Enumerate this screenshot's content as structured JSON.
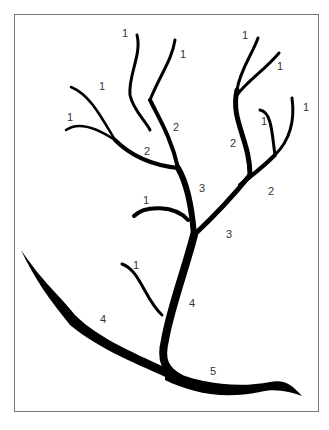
{
  "diagram": {
    "type": "stream-order network",
    "labels": [
      {
        "id": "l1",
        "text": "1",
        "x": 122,
        "y": 28
      },
      {
        "id": "l2",
        "text": "1",
        "x": 180,
        "y": 49
      },
      {
        "id": "l3",
        "text": "1",
        "x": 99,
        "y": 81
      },
      {
        "id": "l4",
        "text": "1",
        "x": 67,
        "y": 112
      },
      {
        "id": "l5",
        "text": "2",
        "x": 173,
        "y": 122
      },
      {
        "id": "l6",
        "text": "2",
        "x": 144,
        "y": 146
      },
      {
        "id": "l7",
        "text": "1",
        "x": 242,
        "y": 30
      },
      {
        "id": "l8",
        "text": "1",
        "x": 277,
        "y": 61
      },
      {
        "id": "l9",
        "text": "1",
        "x": 303,
        "y": 102
      },
      {
        "id": "l10",
        "text": "1",
        "x": 261,
        "y": 116
      },
      {
        "id": "l11",
        "text": "2",
        "x": 230,
        "y": 138
      },
      {
        "id": "l12",
        "text": "2",
        "x": 268,
        "y": 186
      },
      {
        "id": "l13",
        "text": "3",
        "x": 199,
        "y": 183
      },
      {
        "id": "l14",
        "text": "1",
        "x": 143,
        "y": 195
      },
      {
        "id": "l15",
        "text": "3",
        "x": 226,
        "y": 229
      },
      {
        "id": "l16",
        "text": "1",
        "x": 133,
        "y": 260
      },
      {
        "id": "l17",
        "text": "4",
        "x": 100,
        "y": 314
      },
      {
        "id": "l18",
        "text": "4",
        "x": 189,
        "y": 298
      },
      {
        "id": "l19",
        "text": "5",
        "x": 210,
        "y": 366
      }
    ]
  }
}
